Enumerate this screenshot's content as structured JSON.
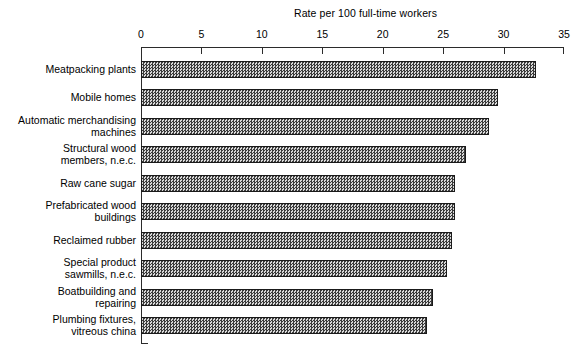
{
  "chart_data": {
    "type": "bar",
    "orientation": "horizontal",
    "title": "Rate per 100 full-time workers",
    "xlabel": "",
    "ylabel": "",
    "xlim": [
      0,
      35
    ],
    "xticks": [
      0,
      5,
      10,
      15,
      20,
      25,
      30,
      35
    ],
    "grid": false,
    "legend": null,
    "categories": [
      "Meatpacking plants",
      "Mobile homes",
      "Automatic merchandising\nmachines",
      "Structural wood\nmembers, n.e.c.",
      "Raw cane sugar",
      "Prefabricated wood\nbuildings",
      "Reclaimed rubber",
      "Special product\nsawmills,  n.e.c.",
      "Boatbuilding and\nrepairing",
      "Plumbing fixtures,\nvitreous china"
    ],
    "values": [
      32.7,
      29.5,
      28.8,
      26.9,
      26.0,
      26.0,
      25.7,
      25.3,
      24.2,
      23.7
    ],
    "series": [
      {
        "name": "Rate per 100 full-time workers",
        "values": [
          32.7,
          29.5,
          28.8,
          26.9,
          26.0,
          26.0,
          25.7,
          25.3,
          24.2,
          23.7
        ]
      }
    ],
    "bar_fill": "#4a4a4a",
    "bar_border": "#1a1a1a",
    "axis_color": "#2b2b2b",
    "background": "#ffffff"
  }
}
